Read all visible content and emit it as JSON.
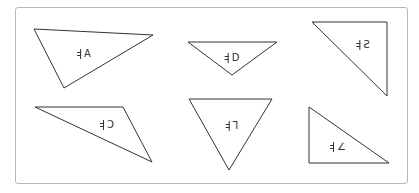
{
  "figure": {
    "frame_border_color": "#b8b8b8",
    "stroke_color": "#333333"
  },
  "triangles": [
    {
      "id": "A",
      "label": "A",
      "mirrored": false,
      "position": "top-left",
      "shape": "scalene obtuse"
    },
    {
      "id": "D",
      "label": "D",
      "mirrored": false,
      "position": "top-middle",
      "shape": "obtuse isosceles, point down"
    },
    {
      "id": "S",
      "label": "S",
      "mirrored": true,
      "position": "top-right",
      "shape": "right triangle"
    },
    {
      "id": "C",
      "label": "C",
      "mirrored": true,
      "position": "bottom-left",
      "shape": "scalene obtuse"
    },
    {
      "id": "F",
      "label": "Γ",
      "mirrored": true,
      "position": "bottom-middle",
      "shape": "acute, point down"
    },
    {
      "id": "K",
      "label": "∠",
      "mirrored": false,
      "position": "bottom-right",
      "shape": "right triangle"
    }
  ]
}
